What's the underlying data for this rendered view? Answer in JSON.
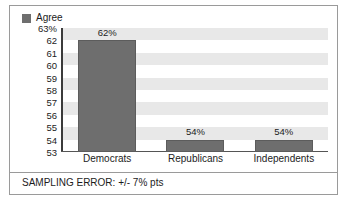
{
  "chart_data": {
    "type": "bar",
    "title": "",
    "xlabel": "",
    "ylabel": "",
    "categories": [
      "Democrats",
      "Republicans",
      "Independents"
    ],
    "values": [
      62,
      54,
      54
    ],
    "value_labels": [
      "62%",
      "54%",
      "54%"
    ],
    "series": [
      {
        "name": "Agree",
        "values": [
          62,
          54,
          54
        ],
        "color": "#6e6e6e"
      }
    ],
    "ylim": [
      53,
      63
    ],
    "y_ticks": [
      63,
      62,
      61,
      60,
      59,
      58,
      57,
      56,
      55,
      54,
      53
    ],
    "y_tick_labels": [
      "63%",
      "62",
      "61",
      "60",
      "59",
      "58",
      "57",
      "56",
      "55",
      "54",
      "53"
    ],
    "grid": "alternating-horizontal-bands",
    "legend_position": "top-left",
    "annotations": [
      "SAMPLING ERROR: +/- 7% pts"
    ]
  },
  "legend": {
    "swatch_name": "legend-color-swatch",
    "label": "Agree"
  },
  "footnote": {
    "text": "SAMPLING ERROR: +/- 7% pts"
  },
  "colors": {
    "bar": "#6e6e6e",
    "band": "#e8e8e8",
    "plot_background": "#ffffff",
    "axis": "#3b3b3b",
    "frame_border": "#9a9a9a",
    "text": "#1c1c1c"
  }
}
